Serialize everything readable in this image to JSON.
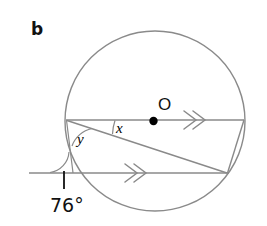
{
  "figure": {
    "part_label": "b",
    "labels": {
      "angle_x": "x",
      "angle_y": "y",
      "center_point": "O",
      "given_angle": "76°"
    },
    "colors": {
      "stroke": "#808080",
      "stroke_dark": "#6b6b6b",
      "text": "#111111",
      "background": "#ffffff",
      "point_fill": "#000000"
    },
    "geometry": {
      "circle": {
        "cx": 155,
        "cy": 121,
        "r": 90
      },
      "center_dot": {
        "cx": 153.5,
        "cy": 121.5,
        "r": 4
      },
      "upper_chord": {
        "x1": 66,
        "y1": 120,
        "x2": 244,
        "y2": 120
      },
      "diagonal_chord": {
        "x1": 67,
        "y1": 121,
        "x2": 227,
        "y2": 173
      },
      "lower_line": {
        "x1": 29,
        "y1": 173,
        "x2": 229,
        "y2": 173
      },
      "right_chord": {
        "x1": 244,
        "y1": 120,
        "x2": 227,
        "y2": 173
      },
      "tick_mark": {
        "x": 64,
        "y1": 172,
        "y2": 189
      }
    },
    "marks": {
      "upper_chevrons": "double-chevron-right",
      "lower_chevrons": "double-chevron-right",
      "right_chevrons": "double-chevron",
      "angle_arc_x": "arc",
      "angle_arc_y": "arc",
      "angle_arc_76": "arc"
    }
  }
}
